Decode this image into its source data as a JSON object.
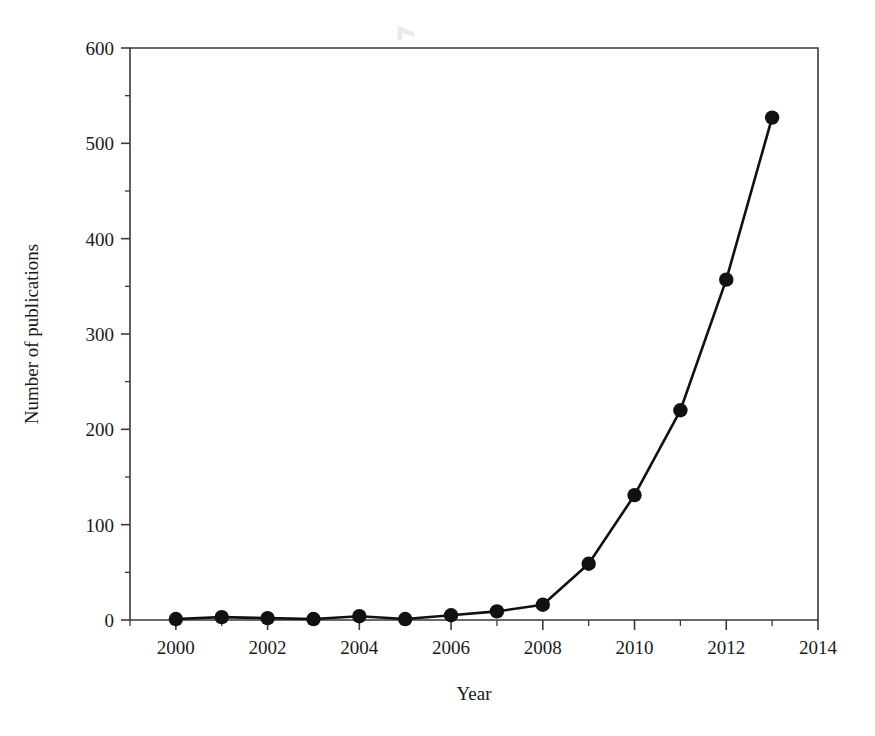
{
  "chart_data": {
    "type": "line",
    "title": "",
    "subtitle": "",
    "xlabel": "Year",
    "ylabel": "Number of publications",
    "x": [
      2000,
      2001,
      2002,
      2003,
      2004,
      2005,
      2006,
      2007,
      2008,
      2009,
      2010,
      2011,
      2012,
      2013
    ],
    "values": [
      1,
      3,
      2,
      1,
      4,
      1,
      5,
      9,
      16,
      59,
      131,
      220,
      357,
      527
    ],
    "series": [
      {
        "name": "Number of publications",
        "values": [
          1,
          3,
          2,
          1,
          4,
          1,
          5,
          9,
          16,
          59,
          131,
          220,
          357,
          527
        ]
      }
    ],
    "xlim": [
      1999,
      2014
    ],
    "ylim": [
      0,
      600
    ],
    "x_major_ticks": [
      2000,
      2002,
      2004,
      2006,
      2008,
      2010,
      2012,
      2014
    ],
    "x_minor_ticks": [
      1999,
      2001,
      2003,
      2005,
      2007,
      2009,
      2011,
      2013
    ],
    "x_tick_labels": [
      "2000",
      "2002",
      "2004",
      "2006",
      "2008",
      "2010",
      "2012",
      "2014"
    ],
    "y_major_ticks": [
      0,
      100,
      200,
      300,
      400,
      500,
      600
    ],
    "y_minor_ticks": [
      50,
      150,
      250,
      350,
      450,
      550
    ],
    "y_tick_labels": [
      "0",
      "100",
      "200",
      "300",
      "400",
      "500",
      "600"
    ],
    "grid": false,
    "legend": false,
    "legend_position": "none",
    "marker": "filled-circle",
    "line_color": "#111111",
    "marker_color": "#111111",
    "background_color": "#ffffff",
    "annotations": []
  }
}
